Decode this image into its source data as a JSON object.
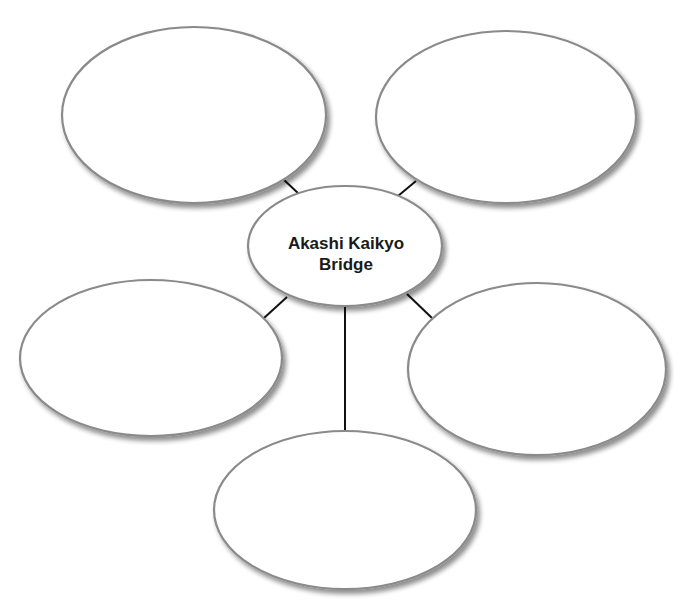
{
  "diagram": {
    "type": "web-organizer",
    "center": {
      "label_line1": "Akashi Kaikyo",
      "label_line2": "Bridge"
    },
    "branches": [
      {
        "position": "top-left",
        "text": ""
      },
      {
        "position": "top-right",
        "text": ""
      },
      {
        "position": "middle-left",
        "text": ""
      },
      {
        "position": "middle-right",
        "text": ""
      },
      {
        "position": "bottom",
        "text": ""
      }
    ],
    "colors": {
      "bubble_fill": "#ffffff",
      "bubble_stroke": "#8a8a8a",
      "connector": "#111111",
      "text": "#1a1a1a"
    }
  }
}
